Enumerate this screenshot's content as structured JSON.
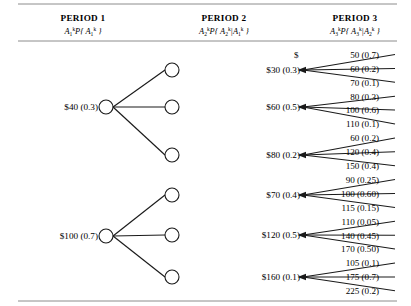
{
  "headers": [
    {
      "title": "PERIOD 1",
      "var": "A",
      "sub": "1",
      "sup": "k",
      "formula_pre": "P{ ",
      "formula_var": "A",
      "formula_sub": "1",
      "formula_sup": "k",
      "formula_post": " }",
      "cond": ""
    },
    {
      "title": "PERIOD 2",
      "var": "A",
      "sub": "2",
      "sup": "k",
      "formula_pre": "P{ ",
      "formula_var": "A",
      "formula_sub": "2",
      "formula_sup": "k",
      "formula_post": " }",
      "cond": "A1k"
    },
    {
      "title": "PERIOD 3",
      "var": "A",
      "sub": "3",
      "sup": "k",
      "formula_pre": "P{ ",
      "formula_var": "A",
      "formula_sub": "3",
      "formula_sup": "k",
      "formula_post": " }",
      "cond": "A2k"
    }
  ],
  "header_labels": {
    "p1_title": "PERIOD 1",
    "p2_title": "PERIOD 2",
    "p3_title": "PERIOD 3"
  },
  "period1": [
    {
      "label": "$40 (0.3)",
      "amount": 40,
      "prob": 0.3,
      "y": 107
    },
    {
      "label": "$100 (0.7)",
      "amount": 100,
      "prob": 0.7,
      "y": 236
    }
  ],
  "period2": [
    {
      "label": "$30 (0.3)",
      "amount": 30,
      "prob": 0.3,
      "parent": 0,
      "y": 70
    },
    {
      "label": "$60 (0.5)",
      "amount": 60,
      "prob": 0.5,
      "parent": 0,
      "y": 107
    },
    {
      "label": "$80 (0.2)",
      "amount": 80,
      "prob": 0.2,
      "parent": 0,
      "y": 155
    },
    {
      "label": "$70 (0.4)",
      "amount": 70,
      "prob": 0.4,
      "parent": 1,
      "y": 195
    },
    {
      "label": "$120 (0.5)",
      "amount": 120,
      "prob": 0.5,
      "parent": 1,
      "y": 235
    },
    {
      "label": "$160 (0.1)",
      "amount": 160,
      "prob": 0.1,
      "parent": 1,
      "y": 277
    }
  ],
  "period3": [
    {
      "label": "50 (0.7)",
      "amount": 50,
      "prob": 0.7,
      "parent": 0,
      "dollar": "$"
    },
    {
      "label": "60 (0.2)",
      "amount": 60,
      "prob": 0.2,
      "parent": 0,
      "dollar": ""
    },
    {
      "label": "70 (0.1)",
      "amount": 70,
      "prob": 0.1,
      "parent": 0,
      "dollar": ""
    },
    {
      "label": "80 (0.3)",
      "amount": 80,
      "prob": 0.3,
      "parent": 1,
      "dollar": ""
    },
    {
      "label": "100 (0.6)",
      "amount": 100,
      "prob": 0.6,
      "parent": 1,
      "dollar": ""
    },
    {
      "label": "110 (0.1)",
      "amount": 110,
      "prob": 0.1,
      "parent": 1,
      "dollar": ""
    },
    {
      "label": "60 (0.2)",
      "amount": 60,
      "prob": 0.2,
      "parent": 2,
      "dollar": ""
    },
    {
      "label": "120 (0.4)",
      "amount": 120,
      "prob": 0.4,
      "parent": 2,
      "dollar": ""
    },
    {
      "label": "150 (0.4)",
      "amount": 150,
      "prob": 0.4,
      "parent": 2,
      "dollar": ""
    },
    {
      "label": "90 (0.25)",
      "amount": 90,
      "prob": 0.25,
      "parent": 3,
      "dollar": ""
    },
    {
      "label": "100 (0.60)",
      "amount": 100,
      "prob": 0.6,
      "parent": 3,
      "dollar": ""
    },
    {
      "label": "115 (0.15)",
      "amount": 115,
      "prob": 0.15,
      "parent": 3,
      "dollar": ""
    },
    {
      "label": "110 (0.05)",
      "amount": 110,
      "prob": 0.05,
      "parent": 4,
      "dollar": ""
    },
    {
      "label": "140 (0.45)",
      "amount": 140,
      "prob": 0.45,
      "parent": 4,
      "dollar": ""
    },
    {
      "label": "170 (0.50)",
      "amount": 170,
      "prob": 0.5,
      "parent": 4,
      "dollar": ""
    },
    {
      "label": "105 (0.1)",
      "amount": 105,
      "prob": 0.1,
      "parent": 5,
      "dollar": ""
    },
    {
      "label": "175 (0.7)",
      "amount": 175,
      "prob": 0.7,
      "parent": 5,
      "dollar": ""
    },
    {
      "label": "225 (0.2)",
      "amount": 225,
      "prob": 0.2,
      "parent": 5,
      "dollar": ""
    }
  ],
  "colors": {
    "ink": "#1a1a1a",
    "rule": "#8c8c8c",
    "paper": "#ffffff"
  }
}
